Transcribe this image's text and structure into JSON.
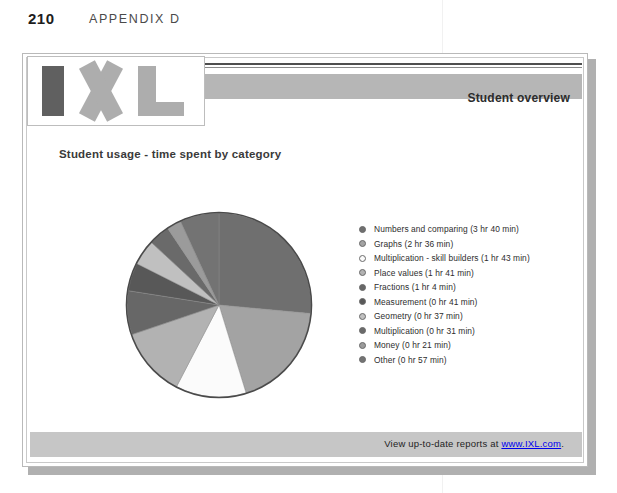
{
  "page": {
    "number": "210",
    "appendix": "APPENDIX D"
  },
  "report": {
    "brand_name": "IXL",
    "header_title": "Student overview",
    "chart_title": "Student usage - time spent by category",
    "footer_prefix": "View up-to-date reports at ",
    "footer_link": "www.IXL.com",
    "footer_suffix": "."
  },
  "chart_data": {
    "type": "pie",
    "title": "Student usage - time spent by category",
    "legend_position": "right",
    "unit": "minutes",
    "total_minutes": 831,
    "start_angle_deg": 0,
    "direction": "clockwise",
    "categories": [
      "Numbers and comparing",
      "Graphs",
      "Multiplication - skill builders",
      "Place values",
      "Fractions",
      "Measurement",
      "Geometry",
      "Multiplication",
      "Money",
      "Other"
    ],
    "values": [
      220,
      156,
      103,
      101,
      64,
      41,
      37,
      31,
      21,
      57
    ],
    "percentages": [
      26.5,
      18.8,
      12.4,
      12.2,
      7.7,
      4.9,
      4.5,
      3.7,
      2.5,
      6.9
    ],
    "colors": [
      "#6f6f6f",
      "#a3a3a3",
      "#fbfbfb",
      "#b2b2b2",
      "#676767",
      "#585858",
      "#c0c0c0",
      "#6a6a6a",
      "#9b9b9b",
      "#737373"
    ],
    "slices": [
      {
        "label": "Numbers and comparing",
        "time": "3 hr 40 min",
        "minutes": 220,
        "legend": "Numbers and comparing (3 hr 40 min)",
        "color": "#6f6f6f"
      },
      {
        "label": "Graphs",
        "time": "2 hr 36 min",
        "minutes": 156,
        "legend": "Graphs (2 hr 36 min)",
        "color": "#a3a3a3"
      },
      {
        "label": "Multiplication - skill builders",
        "time": "1 hr 43 min",
        "minutes": 103,
        "legend": "Multiplication - skill builders (1 hr 43 min)",
        "color": "#fbfbfb"
      },
      {
        "label": "Place values",
        "time": "1 hr 41 min",
        "minutes": 101,
        "legend": "Place values (1 hr 41 min)",
        "color": "#b2b2b2"
      },
      {
        "label": "Fractions",
        "time": "1 hr 4 min",
        "minutes": 64,
        "legend": "Fractions (1 hr 4 min)",
        "color": "#676767"
      },
      {
        "label": "Measurement",
        "time": "0 hr 41 min",
        "minutes": 41,
        "legend": "Measurement (0 hr 41 min)",
        "color": "#585858"
      },
      {
        "label": "Geometry",
        "time": "0 hr 37 min",
        "minutes": 37,
        "legend": "Geometry (0 hr 37 min)",
        "color": "#c0c0c0"
      },
      {
        "label": "Multiplication",
        "time": "0 hr 31 min",
        "minutes": 31,
        "legend": "Multiplication (0 hr 31 min)",
        "color": "#6a6a6a"
      },
      {
        "label": "Money",
        "time": "0 hr 21 min",
        "minutes": 21,
        "legend": "Money (0 hr 21 min)",
        "color": "#9b9b9b"
      },
      {
        "label": "Other",
        "time": "0 hr 57 min",
        "minutes": 57,
        "legend": "Other (0 hr 57 min)",
        "color": "#737373"
      }
    ]
  }
}
